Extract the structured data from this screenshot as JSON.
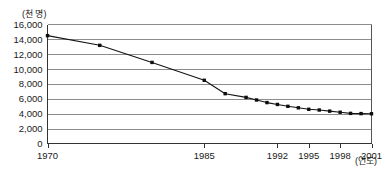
{
  "chart_data": {
    "type": "line",
    "title": "",
    "subtitle": "",
    "xlabel": "(연도)",
    "ylabel": "(천 명)",
    "ylim": [
      0,
      16000
    ],
    "xlim": [
      1970,
      2001
    ],
    "grid": true,
    "legend": false,
    "y_ticks": [
      0,
      2000,
      4000,
      6000,
      8000,
      10000,
      12000,
      14000,
      16000
    ],
    "y_tick_labels": [
      "0",
      "2,000",
      "4,000",
      "6,000",
      "8,000",
      "10,000",
      "12,000",
      "14,000",
      "16,000"
    ],
    "x_ticks": [
      1970,
      1985,
      1992,
      1995,
      1998,
      2001
    ],
    "x_tick_labels": [
      "1970",
      "1985",
      "1992",
      "1995",
      "1998",
      "2001"
    ],
    "marker": "square",
    "line_color": "#141414",
    "grid_color": "#8c8c8c",
    "series": [
      {
        "name": "",
        "x": [
          1970,
          1975,
          1980,
          1985,
          1987,
          1989,
          1990,
          1991,
          1992,
          1993,
          1994,
          1995,
          1996,
          1997,
          1998,
          1999,
          2000,
          2001
        ],
        "values": [
          14500,
          13200,
          10900,
          8500,
          6700,
          6200,
          5850,
          5500,
          5250,
          5000,
          4800,
          4600,
          4500,
          4350,
          4200,
          4050,
          4020,
          4000
        ]
      }
    ],
    "annotations": []
  }
}
